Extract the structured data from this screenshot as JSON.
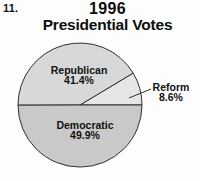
{
  "page": {
    "problem_number": "11."
  },
  "title": {
    "line1": "1996",
    "line2": "Presidential Votes"
  },
  "chart_data": {
    "type": "pie",
    "title": "1996 Presidential Votes",
    "unit": "%",
    "start_angle_deg": 0,
    "direction": "counterclockwise-from-3-oclock",
    "stroke_color": "#2f2f2f",
    "background_color": "#fdfdfd",
    "slices": [
      {
        "label": "Reform",
        "value": 8.6,
        "display": "8.6%",
        "color": "#e6e6e6",
        "label_position": "outside-right-callout"
      },
      {
        "label": "Republican",
        "value": 41.4,
        "display": "41.4%",
        "color": "#d8d8d8",
        "label_position": "inside-top"
      },
      {
        "label": "Democratic",
        "value": 49.9,
        "display": "49.9%",
        "color": "#c9c9c9",
        "label_position": "inside-bottom"
      }
    ]
  }
}
